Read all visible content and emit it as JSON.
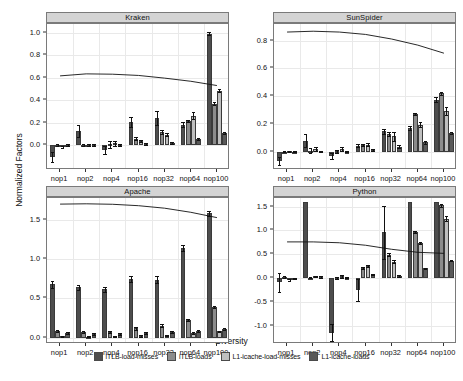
{
  "axis": {
    "ylabel": "Normalized Factors",
    "xlabel": "Diversity"
  },
  "legend": {
    "items": [
      {
        "label": "iTLB-load-misses",
        "color": "#4d4d4d"
      },
      {
        "label": "iTLB-loads",
        "color": "#8c8c8c"
      },
      {
        "label": "L1-icache-load-misses",
        "color": "#bfbfbf"
      },
      {
        "label": "L1-icache-loads",
        "color": "#595959"
      }
    ]
  },
  "chart_data": {
    "type": "bar",
    "title": "",
    "xlabel": "Diversity",
    "ylabel": "Normalized Factors",
    "grid": true,
    "legend_position": "bottom",
    "categories": [
      "nop1",
      "nop2",
      "nop4",
      "nop16",
      "nop32",
      "nop64",
      "nop100"
    ],
    "series_names": [
      "iTLB-load-misses",
      "iTLB-loads",
      "L1-icache-load-misses",
      "L1-icache-loads"
    ],
    "panels": [
      {
        "name": "Kraken",
        "ylim": [
          -0.22,
          1.08
        ],
        "yticks": [
          0.0,
          0.2,
          0.4,
          0.6,
          0.8,
          1.0
        ],
        "ytick_labels": [
          "0.0",
          "0.2",
          "0.4",
          "0.6",
          "0.8",
          "1.0"
        ],
        "series": [
          {
            "name": "iTLB-load-misses",
            "values": [
              -0.105,
              0.125,
              -0.045,
              0.21,
              0.245,
              0.185,
              0.995
            ],
            "err": [
              0.048,
              0.052,
              0.035,
              0.045,
              0.06,
              0.02,
              0.012
            ]
          },
          {
            "name": "iTLB-loads",
            "values": [
              0.005,
              0.005,
              0.01,
              0.06,
              0.115,
              0.215,
              0.372
            ],
            "err": [
              0.008,
              0.008,
              0.03,
              0.012,
              0.018,
              0.012,
              0.01
            ]
          },
          {
            "name": "L1-icache-load-misses",
            "values": [
              -0.012,
              0.006,
              0.02,
              0.035,
              0.095,
              0.262,
              0.487
            ],
            "err": [
              0.008,
              0.008,
              0.022,
              0.01,
              0.015,
              0.03,
              0.016
            ]
          },
          {
            "name": "L1-icache-loads",
            "values": [
              0.004,
              0.004,
              0.006,
              0.014,
              0.022,
              0.055,
              0.112
            ],
            "err": [
              0.006,
              0.006,
              0.008,
              0.008,
              0.01,
              0.008,
              0.008
            ]
          }
        ],
        "line": [
          0.618,
          0.636,
          0.633,
          0.622,
          0.598,
          0.57,
          0.532
        ]
      },
      {
        "name": "SunSpider",
        "ylim": [
          -0.13,
          0.92
        ],
        "yticks": [
          0.0,
          0.2,
          0.4,
          0.6,
          0.8
        ],
        "ytick_labels": [
          "0.0",
          "0.2",
          "0.4",
          "0.6",
          "0.8"
        ],
        "series": [
          {
            "name": "iTLB-load-misses",
            "values": [
              -0.068,
              0.082,
              -0.03,
              0.045,
              0.15,
              0.172,
              0.375
            ],
            "err": [
              0.028,
              0.048,
              0.02,
              0.012,
              0.018,
              0.012,
              0.018
            ]
          },
          {
            "name": "iTLB-loads",
            "values": [
              0.003,
              0.01,
              0.005,
              0.05,
              0.13,
              0.272,
              0.422
            ],
            "err": [
              0.006,
              0.018,
              0.012,
              0.01,
              0.012,
              0.008,
              0.012
            ]
          },
          {
            "name": "L1-icache-load-misses",
            "values": [
              0.004,
              0.022,
              0.022,
              0.052,
              0.112,
              0.197,
              0.292
            ],
            "err": [
              0.006,
              0.014,
              0.016,
              0.01,
              0.032,
              0.02,
              0.03
            ]
          },
          {
            "name": "L1-icache-loads",
            "values": [
              0.002,
              0.004,
              0.003,
              0.012,
              0.038,
              0.068,
              0.135
            ],
            "err": [
              0.005,
              0.006,
              0.006,
              0.006,
              0.01,
              0.008,
              0.008
            ]
          }
        ],
        "line": [
          0.862,
          0.868,
          0.862,
          0.845,
          0.812,
          0.768,
          0.71
        ]
      },
      {
        "name": "Apache",
        "ylim": [
          -0.08,
          1.78
        ],
        "yticks": [
          0.0,
          0.5,
          1.0,
          1.5
        ],
        "ytick_labels": [
          "0.0",
          "0.5",
          "1.0",
          "1.5"
        ],
        "series": [
          {
            "name": "iTLB-load-misses",
            "values": [
              0.68,
              0.64,
              0.62,
              0.745,
              0.74,
              1.14,
              1.585
            ],
            "err": [
              0.048,
              0.032,
              0.032,
              0.035,
              0.04,
              0.038,
              0.03
            ]
          },
          {
            "name": "iTLB-loads",
            "values": [
              0.09,
              0.07,
              0.078,
              0.118,
              0.155,
              0.222,
              0.39
            ],
            "err": [
              0.014,
              0.012,
              0.012,
              0.014,
              0.016,
              0.014,
              0.016
            ]
          },
          {
            "name": "L1-icache-load-misses",
            "values": [
              0.018,
              0.012,
              0.016,
              0.022,
              0.028,
              0.06,
              0.08
            ],
            "err": [
              0.008,
              0.008,
              0.008,
              0.008,
              0.01,
              0.01,
              0.01
            ]
          },
          {
            "name": "L1-icache-loads",
            "values": [
              0.058,
              0.046,
              0.048,
              0.062,
              0.07,
              0.085,
              0.108
            ],
            "err": [
              0.01,
              0.01,
              0.01,
              0.01,
              0.01,
              0.01,
              0.01
            ]
          }
        ],
        "line": [
          1.702,
          1.706,
          1.7,
          1.682,
          1.65,
          1.598,
          1.53
        ]
      },
      {
        "name": "Python",
        "ylim": [
          -1.38,
          1.68
        ],
        "yticks": [
          -1.0,
          -0.5,
          0.0,
          0.5,
          1.0,
          1.5
        ],
        "ytick_labels": [
          "-1.0",
          "-0.5",
          "0.0",
          "0.5",
          "1.0",
          "1.5"
        ],
        "series": [
          {
            "name": "iTLB-load-misses",
            "values": [
              -0.09,
              1.6,
              -1.14,
              -0.25,
              0.96,
              1.6,
              1.6
            ],
            "err": [
              0.19,
              0.0,
              0.185,
              0.225,
              0.56,
              0.0,
              0.0
            ]
          },
          {
            "name": "iTLB-loads",
            "values": [
              0.02,
              0.01,
              0.01,
              0.215,
              0.49,
              0.975,
              1.53
            ],
            "err": [
              0.02,
              0.015,
              0.022,
              0.018,
              0.03,
              0.022,
              0.03
            ]
          },
          {
            "name": "L1-icache-load-misses",
            "values": [
              -0.03,
              0.035,
              0.035,
              0.255,
              0.345,
              0.73,
              1.25
            ],
            "err": [
              0.02,
              0.018,
              0.03,
              0.02,
              0.028,
              0.02,
              0.045
            ]
          },
          {
            "name": "L1-icache-loads",
            "values": [
              -0.01,
              0.025,
              0.012,
              0.07,
              0.045,
              0.205,
              0.37
            ],
            "err": [
              0.015,
              0.014,
              0.014,
              0.014,
              0.014,
              0.014,
              0.016
            ]
          }
        ],
        "line": [
          0.76,
          0.76,
          0.742,
          0.69,
          0.605,
          0.542,
          0.52
        ]
      }
    ]
  }
}
